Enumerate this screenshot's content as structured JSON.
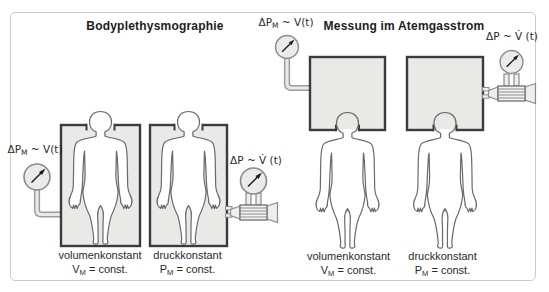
{
  "titles": {
    "left": "Bodyplethysmographie",
    "right": "Messung im Atemgasstrom"
  },
  "gauges": {
    "g1": {
      "label_pre": "ΔP",
      "label_sub": "M",
      "label_post": " ~ V(t)"
    },
    "g2": {
      "label_pre": "ΔP ~ V̇ (t)",
      "label_sub": "",
      "label_post": ""
    },
    "g3": {
      "label_pre": "ΔP",
      "label_sub": "M",
      "label_post": " ~ V(t)"
    },
    "g4": {
      "label_pre": "ΔP ~ V̇ (t)",
      "label_sub": "",
      "label_post": ""
    }
  },
  "captions": {
    "c1": {
      "title": "volumenkonstant",
      "eq_pre": "V",
      "eq_sub": "M",
      "eq_post": " = const."
    },
    "c2": {
      "title": "druckkonstant",
      "eq_pre": "P",
      "eq_sub": "M",
      "eq_post": " = const."
    },
    "c3": {
      "title": "volumenkonstant",
      "eq_pre": "V",
      "eq_sub": "M",
      "eq_post": " = const."
    },
    "c4": {
      "title": "druckkonstant",
      "eq_pre": "P",
      "eq_sub": "M",
      "eq_post": " = const."
    }
  },
  "icons": {
    "pressure-gauge-icon": "circle dial with NE arrow needle",
    "pneumotachograph-icon": "ribbed flow tube with cone and funnel ends",
    "human-figure": "standing front-facing body outline"
  },
  "colors": {
    "box_fill": "#e9e9e7",
    "box_border": "#3b3b39",
    "figure_outline": "#6a6a6a",
    "instrument_outline": "#8a8a88",
    "frame_border": "#cbcbc9",
    "text": "#222220"
  }
}
